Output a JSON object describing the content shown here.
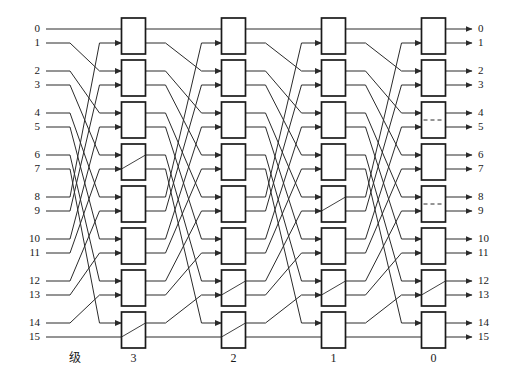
{
  "figure": {
    "kind": "butterfly-interconnection-network",
    "width": 511,
    "height": 381,
    "background_color": "#ffffff",
    "line_color": "#2b2b2b",
    "box_fill_color": "#ffffff",
    "box_stroke_color": "#1a1a1a",
    "text_color": "#1a1a1a"
  },
  "inputs": {
    "labels": [
      "0",
      "1",
      "2",
      "3",
      "4",
      "5",
      "6",
      "7",
      "8",
      "9",
      "10",
      "11",
      "12",
      "13",
      "14",
      "15"
    ]
  },
  "outputs": {
    "labels": [
      "0",
      "1",
      "2",
      "3",
      "4",
      "5",
      "6",
      "7",
      "8",
      "9",
      "10",
      "11",
      "12",
      "13",
      "14",
      "15"
    ]
  },
  "stage_axis": {
    "caption": "级",
    "labels": [
      "3",
      "2",
      "1",
      "0"
    ]
  },
  "chart_data": {
    "type": "diagram",
    "title": "",
    "network": "16x16 butterfly (omega) switching network",
    "stage_count": 4,
    "switches_per_stage": 8,
    "port_count": 16,
    "stage_names": [
      "3",
      "2",
      "1",
      "0"
    ],
    "stage_x_centers": [
      133.5,
      233.5,
      333.5,
      433.5
    ],
    "box_width": 24,
    "box_height": 36,
    "row_y_centers": [
      29,
      43,
      71,
      85,
      113,
      127,
      155,
      169,
      197,
      211,
      239,
      253,
      281,
      295,
      323,
      337
    ],
    "switch_rows": [
      [
        0,
        1
      ],
      [
        2,
        3
      ],
      [
        4,
        5
      ],
      [
        6,
        7
      ],
      [
        8,
        9
      ],
      [
        10,
        11
      ],
      [
        12,
        13
      ],
      [
        14,
        15
      ]
    ],
    "switch_states": {
      "stage3": [
        "through",
        "through",
        "through",
        "cross",
        "through",
        "through",
        "through",
        "cross"
      ],
      "stage2": [
        "through",
        "through",
        "through",
        "through",
        "through",
        "through",
        "cross",
        "cross"
      ],
      "stage1": [
        "through",
        "through",
        "through",
        "through",
        "cross",
        "through",
        "cross",
        "through"
      ],
      "stage0": [
        "through",
        "through",
        "through-marked",
        "through",
        "through-marked",
        "through",
        "cross",
        "through"
      ]
    },
    "permutation_between_stages": "perfect shuffle of 16 lines: line i -> (2*i) mod 15, with line 15 fixed",
    "xlabel": "级",
    "ylabel": ""
  }
}
